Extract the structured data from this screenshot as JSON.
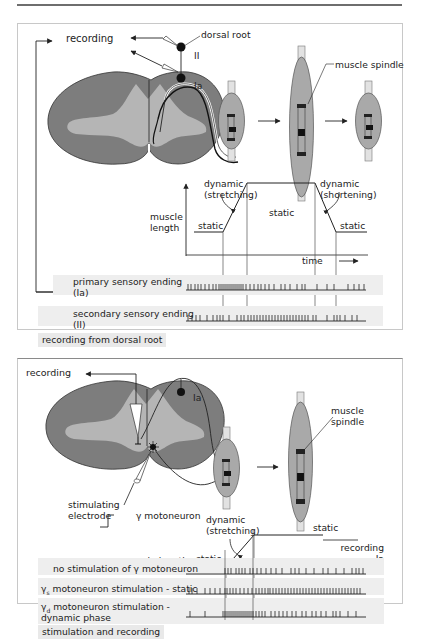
{
  "header": {
    "rule_color": "#6e6e6e"
  },
  "top_panel": {
    "labels": {
      "recording": "recording",
      "dorsal_root": "dorsal root",
      "fiber_II": "II",
      "fiber_Ia": "Ia",
      "muscle_spindle": "muscle spindle",
      "dynamic_stretching": "dynamic\n(stretching)",
      "dynamic_stretching_l1": "dynamic",
      "dynamic_stretching_l2": "(stretching)",
      "dynamic_shortening_l1": "dynamic",
      "dynamic_shortening_l2": "(shortening)",
      "static_left": "static",
      "static_mid": "static",
      "static_right": "static",
      "muscle_length_l1": "muscle",
      "muscle_length_l2": "length",
      "time": "time",
      "primary_l1": "primary sensory ending",
      "primary_l2": "(Ia)",
      "secondary_l1": "secondary  sensory ending",
      "secondary_l2": "(II)"
    },
    "caption": "recording from dorsal root",
    "spindle_sequence": [
      "resting",
      "stretched",
      "shortened"
    ]
  },
  "bottom_panel": {
    "labels": {
      "recording": "recording",
      "fiber_Ia": "Ia",
      "muscle_spindle_l1": "muscle",
      "muscle_spindle_l2": "spindle",
      "stimulating_l1": "stimulating",
      "stimulating_l2": "electrode",
      "gamma_motoneuron": "γ motoneuron",
      "dynamic_l1": "dynamic",
      "dynamic_l2": "(stretching)",
      "static_top": "static",
      "static_left": "static",
      "muscle_length": "muscle length",
      "recording_Ia_l1": "recording",
      "recording_Ia_l2": "Ia",
      "row1": "no stimulation of γ motoneuron",
      "row2_gamma": "γ",
      "row2_sub": "s",
      "row2_rest": " motoneuron stimulation - static",
      "row3_gamma": "γ",
      "row3_sub": "d",
      "row3_rest": " motoneuron stimulation -",
      "row3_l2": "dynamic phase"
    },
    "caption": "stimulation and recording"
  },
  "colors": {
    "cord_white_matter": "#7d7d7d",
    "cord_gray_matter": "#b5b5b5",
    "muscle": "#a9a9a9",
    "tendon": "#e2e2e2",
    "band": "#eeeeee",
    "line": "#222222"
  },
  "spike_trains": {
    "top_primary_Ia": [
      188,
      191,
      195,
      198,
      201,
      205,
      209,
      213,
      216,
      219,
      221,
      223,
      225,
      227,
      229,
      231,
      233,
      235,
      237,
      239,
      241,
      243,
      246,
      250,
      254,
      258,
      261,
      265,
      269,
      274,
      281,
      285,
      290,
      297,
      302,
      305,
      317,
      327,
      334,
      348,
      354,
      359,
      364
    ],
    "top_secondary_II": [
      188,
      192,
      196,
      200,
      207,
      213,
      217,
      220,
      223,
      229,
      237,
      241,
      244,
      248,
      251,
      254,
      257,
      260,
      263,
      266,
      269,
      272,
      275,
      278,
      281,
      284,
      287,
      290,
      293,
      296,
      299,
      302,
      305,
      308,
      313,
      316,
      327,
      334,
      337,
      340,
      345,
      352,
      357
    ],
    "bottom_no_stim": [
      225,
      228,
      231,
      236,
      239,
      242,
      245,
      250,
      253,
      257,
      261,
      266,
      271,
      276,
      282,
      291,
      295,
      299,
      306,
      314,
      323,
      328,
      336,
      344,
      352,
      356,
      359,
      363
    ],
    "bottom_static": [
      189,
      192,
      197,
      205,
      210,
      215,
      220,
      225,
      227,
      230,
      233,
      236,
      240,
      244,
      248,
      252,
      256,
      259,
      262,
      265,
      268,
      270,
      273,
      276,
      279,
      282,
      285,
      288,
      291,
      294,
      297,
      300,
      303,
      306,
      309,
      312,
      315,
      318,
      321,
      324,
      327,
      330,
      333,
      336,
      339,
      342,
      345,
      348,
      351,
      354,
      357,
      360
    ],
    "bottom_dynamic": [
      190,
      205,
      223,
      225,
      227,
      229,
      231,
      233,
      235,
      237,
      239,
      241,
      243,
      245,
      247,
      249,
      251,
      253,
      256,
      259,
      262,
      265,
      271,
      275,
      279,
      283,
      287,
      292,
      296,
      302,
      306,
      312,
      316,
      321,
      326,
      333,
      336,
      340,
      348,
      356
    ]
  }
}
